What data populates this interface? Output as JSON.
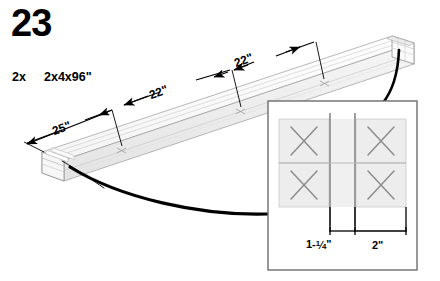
{
  "diagram": {
    "type": "isometric-assembly-instruction",
    "step_number": "23",
    "parts": [
      {
        "quantity": "2x",
        "description": "2x4x96\""
      }
    ],
    "beam": {
      "description": "laminated 2x4 beam assembly shown in isometric view",
      "fastener_count_visible": 3
    },
    "dimensions": [
      {
        "id": "dim-25",
        "label": "25\"",
        "from": "beam-left-end",
        "to": "first-screw"
      },
      {
        "id": "dim-22-a",
        "label": "22\"",
        "from": "first-screw",
        "to": "second-screw"
      },
      {
        "id": "dim-22-b",
        "label": "22\"",
        "from": "second-screw",
        "to": "third-screw"
      }
    ],
    "inset": {
      "title": "cross-section detail",
      "cells": [
        {
          "row": 0,
          "col": 0,
          "symbol": "X"
        },
        {
          "row": 0,
          "col": 1,
          "symbol": "X"
        },
        {
          "row": 1,
          "col": 0,
          "symbol": "X"
        },
        {
          "row": 1,
          "col": 1,
          "symbol": "X"
        }
      ],
      "dimensions": [
        {
          "id": "inset-dim-1",
          "label_prefix": "1-",
          "numerator": "1",
          "denominator": "4",
          "label_suffix": "\"",
          "label_full": "1-1/4\""
        },
        {
          "id": "inset-dim-2",
          "label_full": "2\""
        }
      ]
    },
    "colors": {
      "ink": "#000000",
      "wood_face_light": "#fefefe",
      "wood_face_mid": "#f2f2f2",
      "wood_face_shade": "#e6e6e6",
      "outline": "#9a9a9a",
      "inset_border": "#6e6e6e",
      "inset_fill": "#eeeeee",
      "x_mark": "#8d8d8d",
      "background": "#ffffff"
    }
  }
}
